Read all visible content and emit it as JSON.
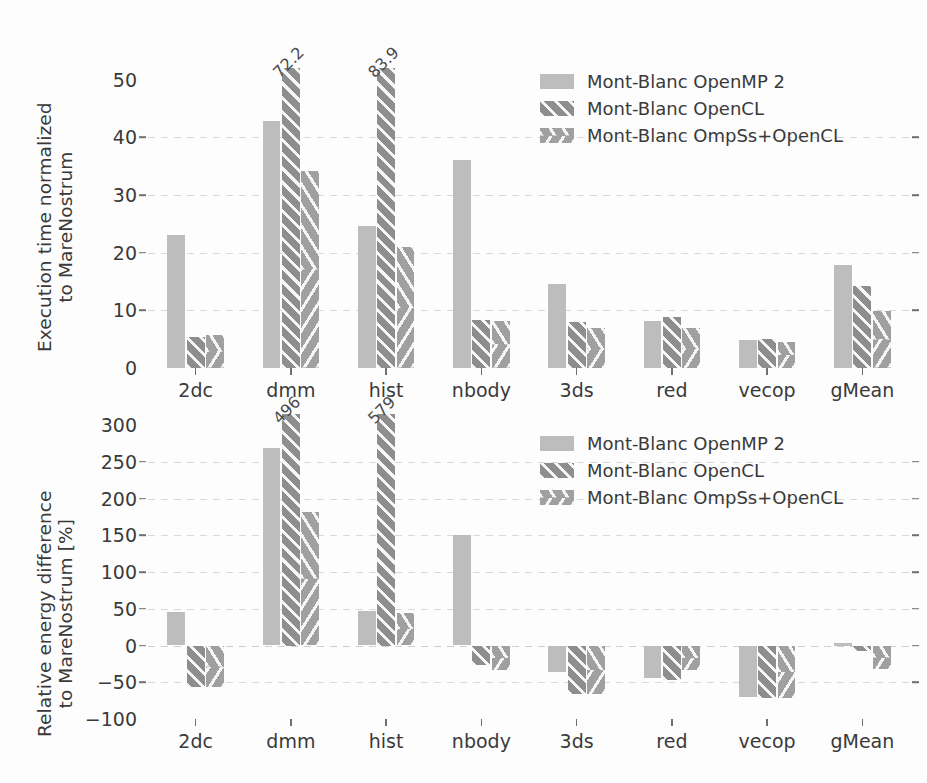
{
  "chart_data": [
    {
      "type": "bar",
      "id": "execution-time",
      "title": "",
      "xlabel": "",
      "ylabel": "Execution time normalized to MareNostrum",
      "ylabel_lines": [
        "Execution time normalized",
        "to MareNostrum"
      ],
      "categories": [
        "2dc",
        "dmm",
        "hist",
        "nbody",
        "3ds",
        "red",
        "vecop",
        "gMean"
      ],
      "ylim": [
        0,
        52
      ],
      "yticks": [
        0,
        10,
        20,
        30,
        40,
        50
      ],
      "ytick_labels": [
        "0",
        "10",
        "20",
        "30",
        "40",
        "50"
      ],
      "grid": true,
      "legend_position": "upper right",
      "series": [
        {
          "name": "Mont-Blanc OpenMP 2",
          "pattern": "solid-speckle",
          "values": [
            23.0,
            42.8,
            24.7,
            36.1,
            14.5,
            8.2,
            4.9,
            17.8
          ]
        },
        {
          "name": "Mont-Blanc OpenCL",
          "pattern": "diagonal-hatch",
          "values": [
            5.3,
            72.2,
            83.9,
            8.3,
            8.0,
            8.8,
            5.1,
            14.2
          ]
        },
        {
          "name": "Mont-Blanc OmpSs+OpenCL",
          "pattern": "chevron-hatch",
          "values": [
            5.8,
            34.2,
            21.0,
            8.2,
            7.0,
            7.0,
            4.5,
            9.8
          ]
        }
      ],
      "annotations": [
        {
          "category": "dmm",
          "series": "Mont-Blanc OpenCL",
          "label": "72.2"
        },
        {
          "category": "hist",
          "series": "Mont-Blanc OpenCL",
          "label": "83.9"
        }
      ]
    },
    {
      "type": "bar",
      "id": "relative-energy",
      "title": "",
      "xlabel": "",
      "ylabel": "Relative energy difference to MareNostrum [%]",
      "ylabel_lines": [
        "Relative energy difference",
        "to MareNostrum [%]"
      ],
      "categories": [
        "2dc",
        "dmm",
        "hist",
        "nbody",
        "3ds",
        "red",
        "vecop",
        "gMean"
      ],
      "ylim": [
        -100,
        315
      ],
      "yticks": [
        -100,
        -50,
        0,
        50,
        100,
        150,
        200,
        250,
        300
      ],
      "ytick_labels": [
        "−100",
        "−50",
        "0",
        "50",
        "100",
        "150",
        "200",
        "250",
        "300"
      ],
      "grid": true,
      "legend_position": "upper right",
      "series": [
        {
          "name": "Mont-Blanc OpenMP 2",
          "pattern": "solid-speckle",
          "values": [
            46,
            269,
            47,
            151,
            -36,
            -44,
            -70,
            3
          ]
        },
        {
          "name": "Mont-Blanc OpenCL",
          "pattern": "diagonal-hatch",
          "values": [
            -57,
            496,
            579,
            -26,
            -66,
            -47,
            -72,
            -8
          ]
        },
        {
          "name": "Mont-Blanc OmpSs+OpenCL",
          "pattern": "chevron-hatch",
          "values": [
            -57,
            181,
            44,
            -34,
            -66,
            -33,
            -72,
            -32
          ]
        }
      ],
      "annotations": [
        {
          "category": "dmm",
          "series": "Mont-Blanc OpenCL",
          "label": "496"
        },
        {
          "category": "hist",
          "series": "Mont-Blanc OpenCL",
          "label": "579"
        }
      ]
    }
  ],
  "colors": {
    "series_openmp": "#bdbdbd",
    "series_opencl": "#8e8e8e",
    "series_ompss": "#a0a0a0",
    "grid": "#d9d9d9",
    "text": "#3a3a3a",
    "background": "#fdfdfd"
  }
}
